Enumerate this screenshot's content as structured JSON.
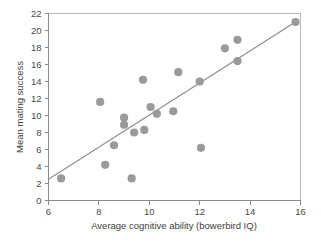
{
  "chart_data": {
    "type": "scatter",
    "title": "",
    "xlabel": "Average cognitive ability (bowerbird IQ)",
    "ylabel": "Mean mating success",
    "xlim": [
      6,
      16
    ],
    "ylim": [
      0,
      22
    ],
    "xticks": [
      6,
      8,
      10,
      12,
      14,
      16
    ],
    "yticks": [
      0,
      2,
      4,
      6,
      8,
      10,
      12,
      14,
      16,
      18,
      20,
      22
    ],
    "xtick_labels": [
      "6",
      "8",
      "10",
      "12",
      "14",
      "16"
    ],
    "ytick_labels": [
      "0",
      "2",
      "4",
      "6",
      "8",
      "10",
      "12",
      "14",
      "16",
      "18",
      "20",
      "22"
    ],
    "grid": false,
    "legend": null,
    "marker": {
      "shape": "circle",
      "color": "#9a9a9a",
      "size": 4.1
    },
    "points": [
      {
        "x": 6.5,
        "y": 2.6
      },
      {
        "x": 8.05,
        "y": 11.6
      },
      {
        "x": 8.25,
        "y": 4.2
      },
      {
        "x": 8.6,
        "y": 6.5
      },
      {
        "x": 9.0,
        "y": 9.75
      },
      {
        "x": 9.0,
        "y": 8.9
      },
      {
        "x": 9.3,
        "y": 2.6
      },
      {
        "x": 9.4,
        "y": 8.0
      },
      {
        "x": 9.75,
        "y": 14.2
      },
      {
        "x": 9.8,
        "y": 8.3
      },
      {
        "x": 10.05,
        "y": 11.0
      },
      {
        "x": 10.3,
        "y": 10.2
      },
      {
        "x": 10.95,
        "y": 10.5
      },
      {
        "x": 11.15,
        "y": 15.1
      },
      {
        "x": 12.0,
        "y": 14.0
      },
      {
        "x": 12.05,
        "y": 6.2
      },
      {
        "x": 13.0,
        "y": 17.9
      },
      {
        "x": 13.5,
        "y": 18.9
      },
      {
        "x": 13.5,
        "y": 16.4
      },
      {
        "x": 15.8,
        "y": 21.0
      }
    ],
    "trend_line": {
      "type": "linear-fit",
      "color": "#8e8e8e",
      "x_start": 6.0,
      "y_start": 2.5,
      "x_end": 15.8,
      "y_end": 21.0
    }
  },
  "axes": {
    "x_axis_name": "x-axis",
    "y_axis_name": "y-axis"
  }
}
